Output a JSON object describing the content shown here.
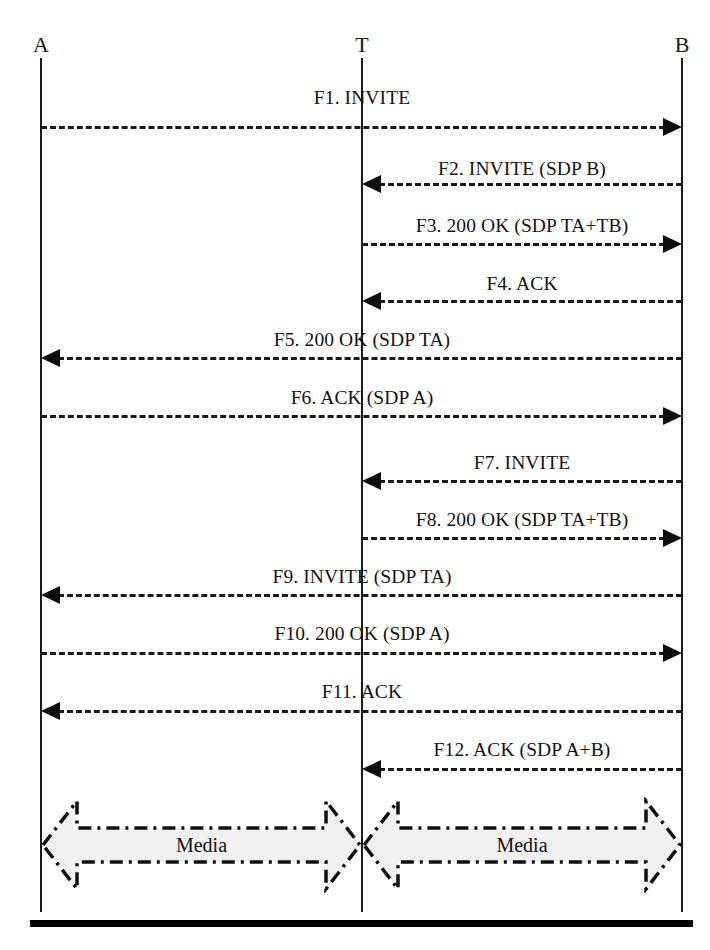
{
  "diagram": {
    "type": "sequence-diagram",
    "width": 710,
    "height": 950,
    "background_color": "#ffffff",
    "line_color": "#1a1a1a",
    "media_fill_color": "#f0f0f0"
  },
  "participants": [
    {
      "id": "A",
      "label": "A",
      "x": 41,
      "label_y": 34
    },
    {
      "id": "T",
      "label": "T",
      "x": 362,
      "label_y": 34
    },
    {
      "id": "B",
      "label": "B",
      "x": 682,
      "label_y": 34
    }
  ],
  "lifelines": [
    {
      "id": "A",
      "x": 41,
      "top": 58,
      "bottom": 912
    },
    {
      "id": "T",
      "x": 362,
      "top": 58,
      "bottom": 912
    },
    {
      "id": "B",
      "x": 682,
      "top": 58,
      "bottom": 912
    }
  ],
  "messages": [
    {
      "id": "F1",
      "label": "F1. INVITE",
      "from": "A",
      "to": "B",
      "direction": "right",
      "label_x": 362,
      "label_y": 87,
      "line_y": 126,
      "x_start": 41,
      "x_end": 682
    },
    {
      "id": "F2",
      "label": "F2. INVITE (SDP B)",
      "from": "B",
      "to": "T",
      "direction": "left",
      "label_x": 522,
      "label_y": 158,
      "line_y": 183,
      "x_start": 362,
      "x_end": 682
    },
    {
      "id": "F3",
      "label": "F3. 200 OK (SDP TA+TB)",
      "from": "T",
      "to": "B",
      "direction": "right",
      "label_x": 522,
      "label_y": 215,
      "line_y": 243,
      "x_start": 362,
      "x_end": 682
    },
    {
      "id": "F4",
      "label": "F4. ACK",
      "from": "B",
      "to": "T",
      "direction": "left",
      "label_x": 522,
      "label_y": 273,
      "line_y": 300,
      "x_start": 362,
      "x_end": 682
    },
    {
      "id": "F5",
      "label": "F5. 200 OK (SDP TA)",
      "from": "B",
      "to": "A",
      "direction": "left",
      "label_x": 362,
      "label_y": 329,
      "line_y": 357,
      "x_start": 41,
      "x_end": 682
    },
    {
      "id": "F6",
      "label": "F6. ACK (SDP A)",
      "from": "A",
      "to": "B",
      "direction": "right",
      "label_x": 362,
      "label_y": 387,
      "line_y": 415,
      "x_start": 41,
      "x_end": 682
    },
    {
      "id": "F7",
      "label": "F7. INVITE",
      "from": "B",
      "to": "T",
      "direction": "left",
      "label_x": 522,
      "label_y": 452,
      "line_y": 480,
      "x_start": 362,
      "x_end": 682
    },
    {
      "id": "F8",
      "label": "F8. 200 OK (SDP TA+TB)",
      "from": "T",
      "to": "B",
      "direction": "right",
      "label_x": 522,
      "label_y": 509,
      "line_y": 537,
      "x_start": 362,
      "x_end": 682
    },
    {
      "id": "F9",
      "label": "F9. INVITE (SDP TA)",
      "from": "B",
      "to": "A",
      "direction": "left",
      "label_x": 362,
      "label_y": 566,
      "line_y": 594,
      "x_start": 41,
      "x_end": 682
    },
    {
      "id": "F10",
      "label": "F10. 200 OK (SDP A)",
      "from": "A",
      "to": "B",
      "direction": "right",
      "label_x": 362,
      "label_y": 623,
      "line_y": 652,
      "x_start": 41,
      "x_end": 682
    },
    {
      "id": "F11",
      "label": "F11. ACK",
      "from": "B",
      "to": "A",
      "direction": "left",
      "label_x": 362,
      "label_y": 681,
      "line_y": 710,
      "x_start": 41,
      "x_end": 682
    },
    {
      "id": "F12",
      "label": "F12. ACK (SDP A+B)",
      "from": "B",
      "to": "T",
      "direction": "left",
      "label_x": 522,
      "label_y": 739,
      "line_y": 768,
      "x_start": 362,
      "x_end": 682
    }
  ],
  "media_flows": [
    {
      "id": "media-left",
      "label": "Media",
      "from": "A",
      "to": "T",
      "x_start": 41,
      "x_end": 362,
      "center_y": 845
    },
    {
      "id": "media-right",
      "label": "Media",
      "from": "T",
      "to": "B",
      "x_start": 362,
      "x_end": 682,
      "center_y": 845
    }
  ],
  "bottom_rule": {
    "x": 30,
    "y": 920,
    "width": 663,
    "height": 7
  }
}
